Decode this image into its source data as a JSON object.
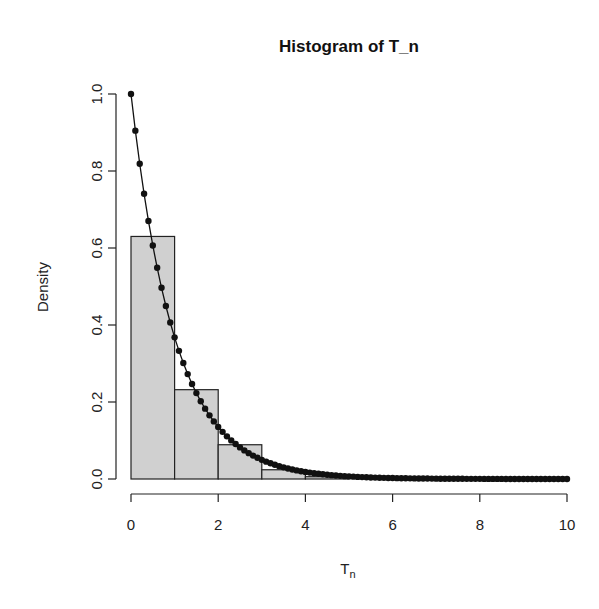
{
  "chart_data": {
    "type": "bar",
    "title": "Histogram of T_n",
    "xlabel": "T_n",
    "ylabel": "Density",
    "xlim": [
      0,
      10
    ],
    "ylim": [
      0,
      1.0
    ],
    "x_ticks": [
      "0",
      "2",
      "4",
      "6",
      "8",
      "10"
    ],
    "y_ticks": [
      "0.0",
      "0.2",
      "0.4",
      "0.6",
      "0.8",
      "1.0"
    ],
    "grid": false,
    "legend": null,
    "histogram": {
      "bins": [
        [
          0,
          1
        ],
        [
          1,
          2
        ],
        [
          2,
          3
        ],
        [
          3,
          4
        ],
        [
          4,
          5
        ]
      ],
      "density": [
        0.63,
        0.232,
        0.089,
        0.024,
        0.006
      ],
      "fill": "#d0d0d0",
      "border": "#222222"
    },
    "overlay_curve": {
      "type": "line+points",
      "description": "exp(-x) density evaluated at x = 0, 0.1, ..., 10",
      "function": "exp(-x)",
      "x_start": 0,
      "x_end": 10,
      "step": 0.1,
      "color": "#111111"
    }
  }
}
